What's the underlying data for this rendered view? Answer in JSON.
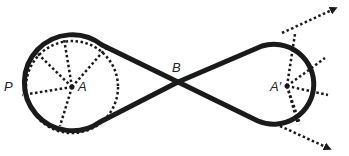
{
  "diagram": {
    "type": "belt-loop-figure-eight",
    "colors": {
      "stroke": "#1a1a1a",
      "background": "#ffffff"
    },
    "labels": {
      "P": "P",
      "A": "A",
      "B": "B",
      "A_prime": "A′"
    },
    "left_circle": {
      "center_label": "A",
      "point_label": "P",
      "radial_lines": 5
    },
    "right_circle": {
      "center_label": "A′",
      "radial_lines": 5
    },
    "crossing_point_label": "B",
    "arrows": [
      {
        "direction": "up-right",
        "style": "dotted"
      },
      {
        "direction": "down-right",
        "style": "dotted"
      }
    ]
  }
}
